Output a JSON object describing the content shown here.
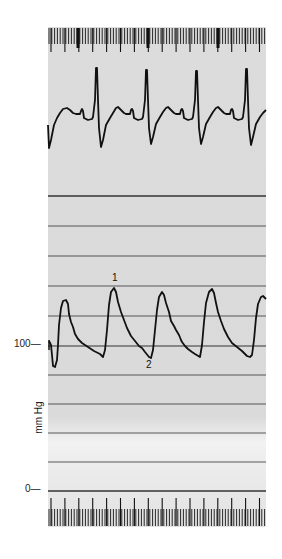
{
  "figure": {
    "y_axis": {
      "unit_label": "mm Hg",
      "ticks": [
        {
          "label": "100—",
          "value": 100
        },
        {
          "label": "0—",
          "value": 0
        }
      ]
    },
    "annotations": [
      {
        "label": "1",
        "meaning": "systolic peak"
      },
      {
        "label": "2",
        "meaning": "end-diastolic trough"
      }
    ]
  },
  "chart_data": [
    {
      "type": "line",
      "title": "",
      "name": "ECG trace",
      "xlabel": "",
      "ylabel": "",
      "beats_visible": 4,
      "description": "Regular rhythm with tall narrow R waves, deep S waves, T wave and small P wave between beats",
      "grid": false
    },
    {
      "type": "line",
      "title": "",
      "name": "Arterial pressure trace",
      "xlabel": "",
      "ylabel": "mm Hg",
      "ylim": [
        0,
        200
      ],
      "yticks": [
        0,
        100
      ],
      "grid_interval_mmHg": 20,
      "grid": true,
      "beats_visible": 5,
      "systolic_peaks_mmHg": [
        145,
        160,
        160,
        162,
        148
      ],
      "diastolic_troughs_mmHg": [
        88,
        93,
        90,
        92,
        90
      ],
      "annotations": [
        {
          "label": "1",
          "at": "systolic peak of beat 2",
          "value_mmHg": 160
        },
        {
          "label": "2",
          "at": "trough before beat 3",
          "value_mmHg": 90
        }
      ]
    }
  ]
}
